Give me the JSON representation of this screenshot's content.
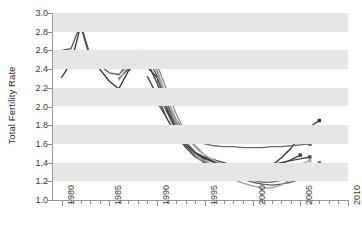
{
  "chart_data": {
    "type": "line",
    "title": "",
    "xlabel": "",
    "ylabel": "Total Fertility Rate",
    "xlim": [
      1979,
      2010
    ],
    "ylim": [
      1.0,
      3.0
    ],
    "grid": "horizontal-alternating-bands",
    "legend": "none",
    "x_ticks": [
      1980,
      1985,
      1990,
      1995,
      2000,
      2005,
      2010
    ],
    "x_tick_labels": [
      "1980",
      "1985",
      "1990",
      "1995",
      "2000",
      "2005",
      "2010"
    ],
    "x_minor_tick_interval": 1,
    "y_ticks": [
      1.0,
      1.2,
      1.4,
      1.6,
      1.8,
      2.0,
      2.2,
      2.4,
      2.6,
      2.8,
      3.0
    ],
    "y_tick_labels": [
      "1.0",
      "1.2",
      "1.4",
      "1.6",
      "1.8",
      "2.0",
      "2.2",
      "2.4",
      "2.6",
      "2.8",
      "3.0"
    ],
    "series": [
      {
        "name": "series-1",
        "color": "#2f2f2f",
        "x": [
          1980,
          1981,
          1982,
          1983,
          1984,
          1985,
          1986,
          1987,
          1988,
          1989,
          1990,
          1991,
          1992,
          1993,
          1994,
          1995,
          1996,
          1997,
          1998,
          1999,
          2000,
          2001,
          2002,
          2003,
          2004,
          2005,
          2006,
          2007
        ],
        "values": [
          2.31,
          2.47,
          2.86,
          2.52,
          2.4,
          2.27,
          2.19,
          2.38,
          2.5,
          2.42,
          2.31,
          2.05,
          1.8,
          1.62,
          1.51,
          1.45,
          1.41,
          1.38,
          1.35,
          1.32,
          1.32,
          1.34,
          1.37,
          1.45,
          1.55,
          1.68,
          1.78,
          1.85
        ]
      },
      {
        "name": "series-2",
        "color": "#555555",
        "x": [
          1980,
          1981,
          1982,
          1983,
          1984,
          1985,
          1986,
          1987,
          1988,
          1989,
          1990,
          1991,
          1992,
          1993,
          1994,
          1995,
          1996,
          1997,
          1998,
          1999,
          2000,
          2001,
          2002,
          2003,
          2004,
          2005,
          2006
        ],
        "values": [
          2.6,
          2.62,
          2.88,
          2.55,
          2.44,
          2.36,
          2.34,
          2.46,
          2.6,
          2.52,
          2.33,
          2.01,
          1.83,
          1.7,
          1.66,
          1.68,
          1.7,
          1.72,
          1.72,
          1.71,
          1.7,
          1.69,
          1.7,
          1.71,
          1.72,
          1.73,
          1.74
        ]
      },
      {
        "name": "series-3",
        "color": "#3d3d3d",
        "x": [
          1986,
          1987,
          1988,
          1989,
          1990,
          1991,
          1992,
          1993,
          1994,
          1995,
          1996,
          1997,
          1998,
          1999,
          2000,
          2001,
          2002,
          2003,
          2004,
          2005,
          2006
        ],
        "values": [
          2.3,
          2.4,
          2.52,
          2.47,
          2.25,
          1.98,
          1.79,
          1.68,
          1.65,
          1.67,
          1.68,
          1.68,
          1.67,
          1.66,
          1.65,
          1.64,
          1.63,
          1.62,
          1.62,
          1.61,
          1.6
        ]
      },
      {
        "name": "series-4",
        "color": "#6b6b6b",
        "x": [
          1989,
          1990,
          1991,
          1992,
          1993,
          1994,
          1995,
          1996,
          1997,
          1998,
          1999,
          2000,
          2001,
          2002,
          2003,
          2004,
          2005,
          2006
        ],
        "values": [
          2.58,
          2.38,
          2.05,
          1.86,
          1.72,
          1.64,
          1.6,
          1.58,
          1.57,
          1.57,
          1.56,
          1.56,
          1.56,
          1.57,
          1.57,
          1.58,
          1.59,
          1.6
        ]
      },
      {
        "name": "series-5",
        "color": "#404040",
        "x": [
          1989,
          1990,
          1991,
          1992,
          1993,
          1994,
          1995,
          1996,
          1997,
          1998,
          1999,
          2000,
          2001,
          2002,
          2003,
          2004,
          2005
        ],
        "values": [
          2.32,
          2.12,
          1.88,
          1.7,
          1.58,
          1.5,
          1.46,
          1.43,
          1.4,
          1.37,
          1.34,
          1.33,
          1.34,
          1.36,
          1.39,
          1.43,
          1.48
        ]
      },
      {
        "name": "series-6",
        "color": "#8a8a8a",
        "x": [
          1990,
          1991,
          1992,
          1993,
          1994,
          1995,
          1996,
          1997,
          1998,
          1999,
          2000,
          2001,
          2002,
          2003,
          2004,
          2005,
          2006
        ],
        "values": [
          2.45,
          2.18,
          1.92,
          1.72,
          1.58,
          1.48,
          1.42,
          1.37,
          1.33,
          1.29,
          1.26,
          1.24,
          1.24,
          1.26,
          1.29,
          1.33,
          1.37
        ]
      },
      {
        "name": "series-7",
        "color": "#4a4a4a",
        "x": [
          1990,
          1991,
          1992,
          1993,
          1994,
          1995,
          1996,
          1997,
          1998,
          1999,
          2000,
          2001,
          2002,
          2003,
          2004,
          2005,
          2006
        ],
        "values": [
          2.05,
          1.88,
          1.7,
          1.56,
          1.46,
          1.4,
          1.35,
          1.31,
          1.28,
          1.25,
          1.23,
          1.22,
          1.23,
          1.25,
          1.28,
          1.31,
          1.34
        ]
      },
      {
        "name": "series-8",
        "color": "#7a7a7a",
        "x": [
          1990,
          1991,
          1992,
          1993,
          1994,
          1995,
          1996,
          1997,
          1998,
          1999,
          2000,
          2001,
          2002,
          2003,
          2004,
          2005,
          2006,
          2007
        ],
        "values": [
          2.28,
          2.02,
          1.8,
          1.62,
          1.5,
          1.42,
          1.36,
          1.32,
          1.28,
          1.24,
          1.21,
          1.19,
          1.19,
          1.21,
          1.25,
          1.3,
          1.36,
          1.4
        ]
      },
      {
        "name": "series-9",
        "color": "#5e5e5e",
        "x": [
          1990,
          1991,
          1992,
          1993,
          1994,
          1995,
          1996,
          1997,
          1998,
          1999,
          2000,
          2001,
          2002,
          2003,
          2004,
          2005,
          2006
        ],
        "values": [
          2.15,
          1.95,
          1.74,
          1.58,
          1.47,
          1.4,
          1.34,
          1.3,
          1.26,
          1.22,
          1.19,
          1.17,
          1.16,
          1.17,
          1.19,
          1.22,
          1.26
        ]
      },
      {
        "name": "series-10",
        "color": "#9b9b9b",
        "x": [
          1990,
          1991,
          1992,
          1993,
          1994,
          1995,
          1996,
          1997,
          1998,
          1999,
          2000,
          2001,
          2002,
          2003,
          2004,
          2005,
          2006,
          2007
        ],
        "values": [
          2.35,
          2.08,
          1.82,
          1.62,
          1.48,
          1.38,
          1.31,
          1.26,
          1.22,
          1.18,
          1.15,
          1.13,
          1.13,
          1.16,
          1.22,
          1.28,
          1.33,
          1.36
        ]
      },
      {
        "name": "series-11",
        "color": "#454545",
        "x": [
          1991,
          1992,
          1993,
          1994,
          1995,
          1996,
          1997,
          1998,
          1999,
          2000,
          2001,
          2002,
          2003,
          2004,
          2005,
          2006
        ],
        "values": [
          1.96,
          1.76,
          1.6,
          1.5,
          1.44,
          1.4,
          1.38,
          1.37,
          1.36,
          1.36,
          1.37,
          1.38,
          1.4,
          1.42,
          1.44,
          1.46
        ]
      },
      {
        "name": "series-12",
        "color": "#a8a8a8",
        "x": [
          1986,
          1987,
          1988,
          1989,
          1990,
          1991,
          1992,
          1993,
          1994,
          1995,
          1996,
          1997,
          1998,
          1999,
          2000,
          2001,
          2002,
          2003,
          2004,
          2005,
          2006
        ],
        "values": [
          2.28,
          2.44,
          2.6,
          2.5,
          2.4,
          2.1,
          1.86,
          1.68,
          1.56,
          1.48,
          1.42,
          1.38,
          1.34,
          1.31,
          1.29,
          1.28,
          1.29,
          1.31,
          1.34,
          1.38,
          1.42
        ]
      }
    ]
  }
}
